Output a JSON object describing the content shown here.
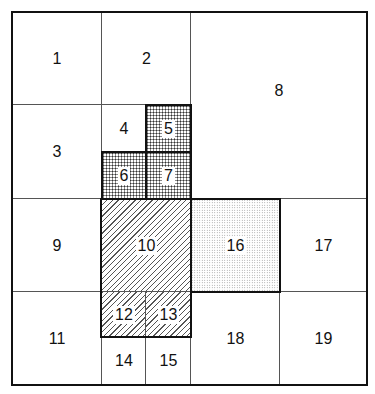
{
  "diagram": {
    "type": "grid-partition",
    "cells": [
      {
        "id": "1",
        "label": "1",
        "x": 12,
        "y": 12,
        "w": 90,
        "h": 93,
        "fill": "none"
      },
      {
        "id": "2",
        "label": "2",
        "x": 102,
        "y": 12,
        "w": 89,
        "h": 93,
        "fill": "none"
      },
      {
        "id": "3",
        "label": "3",
        "x": 12,
        "y": 105,
        "w": 90,
        "h": 94,
        "fill": "none"
      },
      {
        "id": "4",
        "label": "4",
        "x": 102,
        "y": 105,
        "w": 44,
        "h": 47,
        "fill": "none"
      },
      {
        "id": "5",
        "label": "5",
        "x": 146,
        "y": 105,
        "w": 45,
        "h": 47,
        "fill": "crosshatch"
      },
      {
        "id": "6",
        "label": "6",
        "x": 102,
        "y": 152,
        "w": 44,
        "h": 47,
        "fill": "crosshatch"
      },
      {
        "id": "7",
        "label": "7",
        "x": 146,
        "y": 152,
        "w": 45,
        "h": 47,
        "fill": "crosshatch"
      },
      {
        "id": "8",
        "label": "8",
        "x": 191,
        "y": 12,
        "w": 176,
        "h": 187,
        "fill": "none"
      },
      {
        "id": "9",
        "label": "9",
        "x": 12,
        "y": 199,
        "w": 90,
        "h": 93,
        "fill": "none"
      },
      {
        "id": "10",
        "label": "10",
        "x": 102,
        "y": 199,
        "w": 89,
        "h": 93,
        "fill": "diagonal-hatch"
      },
      {
        "id": "11",
        "label": "11",
        "x": 12,
        "y": 292,
        "w": 90,
        "h": 93,
        "fill": "none"
      },
      {
        "id": "12",
        "label": "12",
        "x": 102,
        "y": 292,
        "w": 44,
        "h": 45,
        "fill": "diagonal-hatch"
      },
      {
        "id": "13",
        "label": "13",
        "x": 146,
        "y": 292,
        "w": 45,
        "h": 45,
        "fill": "diagonal-hatch"
      },
      {
        "id": "14",
        "label": "14",
        "x": 102,
        "y": 337,
        "w": 44,
        "h": 48,
        "fill": "none"
      },
      {
        "id": "15",
        "label": "15",
        "x": 146,
        "y": 337,
        "w": 45,
        "h": 48,
        "fill": "none"
      },
      {
        "id": "16",
        "label": "16",
        "x": 191,
        "y": 199,
        "w": 89,
        "h": 93,
        "fill": "stipple"
      },
      {
        "id": "17",
        "label": "17",
        "x": 280,
        "y": 199,
        "w": 87,
        "h": 93,
        "fill": "none"
      },
      {
        "id": "18",
        "label": "18",
        "x": 191,
        "y": 292,
        "w": 89,
        "h": 93,
        "fill": "none"
      },
      {
        "id": "19",
        "label": "19",
        "x": 280,
        "y": 292,
        "w": 87,
        "h": 93,
        "fill": "none"
      }
    ]
  }
}
